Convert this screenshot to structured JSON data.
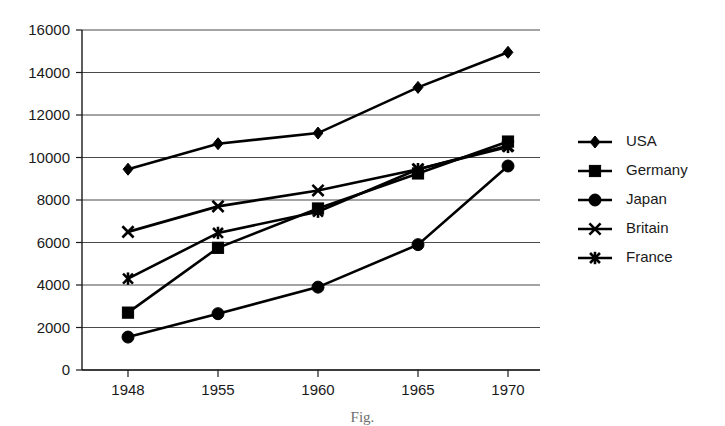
{
  "caption": "Fig.",
  "chart_data": {
    "type": "line",
    "title": "",
    "xlabel": "",
    "ylabel": "",
    "categories": [
      "1948",
      "1955",
      "1960",
      "1965",
      "1970"
    ],
    "ylim": [
      0,
      16000
    ],
    "ytick_step": 2000,
    "yticks": [
      "0",
      "2000",
      "4000",
      "6000",
      "8000",
      "10000",
      "12000",
      "14000",
      "16000"
    ],
    "grid": "horizontal",
    "legend_position": "right",
    "series": [
      {
        "name": "USA",
        "marker": "diamond",
        "color": "#000000",
        "values": [
          9450,
          10650,
          11150,
          13300,
          14950
        ]
      },
      {
        "name": "Germany",
        "marker": "square",
        "color": "#000000",
        "values": [
          2700,
          5750,
          7600,
          9250,
          10750
        ]
      },
      {
        "name": "Japan",
        "marker": "circle",
        "color": "#000000",
        "values": [
          1550,
          2650,
          3900,
          5900,
          9600
        ]
      },
      {
        "name": "Britain",
        "marker": "x",
        "color": "#000000",
        "values": [
          6500,
          7700,
          8450,
          9450,
          10550
        ]
      },
      {
        "name": "France",
        "marker": "star",
        "color": "#000000",
        "values": [
          4300,
          6450,
          7450,
          9450,
          10500
        ]
      }
    ]
  }
}
